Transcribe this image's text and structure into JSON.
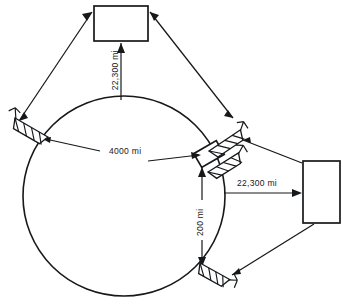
{
  "diagram": {
    "type": "satellite-communication-schematic",
    "title": "",
    "earth": {
      "name": "earth-circle",
      "diameter_label": "4000 mi"
    },
    "labels": {
      "geo_altitude_top": "22,300 mi",
      "earth_diameter": "4000 mi",
      "low_orbit_altitude": "200 mi",
      "geo_altitude_right": "22,300 mi"
    },
    "nodes": [
      {
        "name": "satellite-top",
        "shape": "rectangle",
        "label": ""
      },
      {
        "name": "satellite-right",
        "shape": "rectangle",
        "label": ""
      },
      {
        "name": "low-orbit-satellite",
        "shape": "small-tilted-rectangle",
        "label": ""
      }
    ],
    "ground_stations": [
      {
        "name": "dish-antenna-upper-left",
        "label": ""
      },
      {
        "name": "dish-antenna-upper-right",
        "label": ""
      },
      {
        "name": "dish-antenna-mid-right",
        "label": ""
      },
      {
        "name": "dish-antenna-lower-right",
        "label": ""
      }
    ],
    "colors": {
      "ink": "#16181a",
      "background": "#ffffff"
    }
  }
}
